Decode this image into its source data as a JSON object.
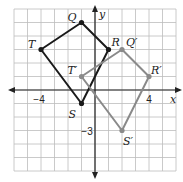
{
  "grid": {
    "min": -6,
    "max": 6,
    "unit_px": 13.5,
    "origin_px": [
      95,
      90
    ],
    "line_color": "#bdbdbd"
  },
  "axes": {
    "x_label": "x",
    "y_label": "y",
    "color": "#222222"
  },
  "tick_labels": [
    {
      "text": "−4",
      "x": -4,
      "y": 0,
      "dx": -2,
      "dy": 13
    },
    {
      "text": "4",
      "x": 4,
      "y": 0,
      "dx": 0,
      "dy": 13
    },
    {
      "text": "−3",
      "x": 0,
      "y": -3,
      "dx": -8,
      "dy": 4
    }
  ],
  "figures": [
    {
      "name": "QRST",
      "color": "#1a1a1a",
      "vertices": [
        {
          "label": "Q",
          "x": -1,
          "y": 5,
          "ldx": -14,
          "ldy": -2
        },
        {
          "label": "R",
          "x": 1,
          "y": 3,
          "ldx": 3,
          "ldy": -4
        },
        {
          "label": "S",
          "x": -1,
          "y": -1,
          "ldx": -13,
          "ldy": 14
        },
        {
          "label": "T",
          "x": -4,
          "y": 3,
          "ldx": -13,
          "ldy": -2
        }
      ]
    },
    {
      "name": "Q'R'S'T'",
      "color": "#8a8a8a",
      "vertices": [
        {
          "label": "Q′",
          "x": 2,
          "y": 3,
          "ldx": 4,
          "ldy": -4
        },
        {
          "label": "R′",
          "x": 4,
          "y": 1,
          "ldx": 2,
          "ldy": -3
        },
        {
          "label": "S′",
          "x": 2,
          "y": -3,
          "ldx": 1,
          "ldy": 14
        },
        {
          "label": "T′",
          "x": -1,
          "y": 1,
          "ldx": -14,
          "ldy": -3
        }
      ]
    }
  ]
}
